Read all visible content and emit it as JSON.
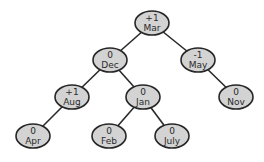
{
  "diagram": {
    "type": "AVL tree with balance factors",
    "root": "Mar",
    "nodes": [
      {
        "id": "Mar",
        "label": "Mar",
        "balance": "+1"
      },
      {
        "id": "Dec",
        "label": "Dec",
        "balance": "0"
      },
      {
        "id": "May",
        "label": "May",
        "balance": "-1"
      },
      {
        "id": "Aug",
        "label": "Aug",
        "balance": "+1"
      },
      {
        "id": "Jan",
        "label": "Jan",
        "balance": "0"
      },
      {
        "id": "Nov",
        "label": "Nov",
        "balance": "0"
      },
      {
        "id": "Apr",
        "label": "Apr",
        "balance": "0"
      },
      {
        "id": "Feb",
        "label": "Feb",
        "balance": "0"
      },
      {
        "id": "July",
        "label": "July",
        "balance": "0"
      }
    ],
    "edges": [
      {
        "from": "Mar",
        "to": "Dec",
        "side": "left"
      },
      {
        "from": "Mar",
        "to": "May",
        "side": "right"
      },
      {
        "from": "Dec",
        "to": "Aug",
        "side": "left"
      },
      {
        "from": "Dec",
        "to": "Jan",
        "side": "right"
      },
      {
        "from": "May",
        "to": "Nov",
        "side": "right"
      },
      {
        "from": "Aug",
        "to": "Apr",
        "side": "left"
      },
      {
        "from": "Jan",
        "to": "Feb",
        "side": "left"
      },
      {
        "from": "Jan",
        "to": "July",
        "side": "right"
      }
    ],
    "colors": {
      "node_fill": "#d3d3d3",
      "node_stroke": "#262626",
      "edge": "#2a2a2a",
      "text": "#2a2a2a"
    }
  }
}
